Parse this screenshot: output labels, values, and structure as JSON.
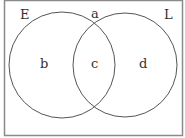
{
  "diagram": {
    "type": "venn",
    "sets": [
      {
        "label": "E",
        "region": "b"
      },
      {
        "label": "L",
        "region": "d"
      }
    ],
    "regions": {
      "outside": "a",
      "only_left": "b",
      "intersection": "c",
      "only_right": "d"
    },
    "colors": {
      "stroke": "#555555",
      "border": "#888888",
      "text": "#333333"
    }
  }
}
